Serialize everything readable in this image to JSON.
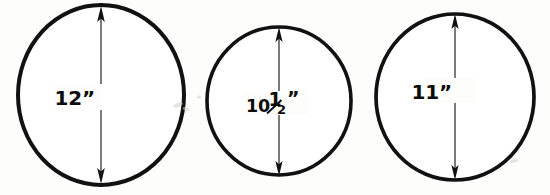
{
  "figure": {
    "type": "technical-dimension-diagram",
    "background_color": "#fdfdfc",
    "ink_color": "#111111",
    "circle_count": 3
  },
  "circles": [
    {
      "id": "circle-1",
      "label": "12”",
      "diameter_value": "12",
      "unit_symbol": "”",
      "cx": 101,
      "cy": 95,
      "rx": 83,
      "ry": 90,
      "stroke_width": 4.0,
      "dimension": {
        "line_x": 101,
        "top_y": 8,
        "bottom_y": 182,
        "label_x": 95,
        "label_y": 104,
        "label_anchor": "end"
      }
    },
    {
      "id": "circle-2",
      "label": "10½”",
      "diameter_value": "10½",
      "whole_part": "10",
      "fraction_numerator": "1",
      "fraction_denominator": "2",
      "unit_symbol": "”",
      "cx": 279,
      "cy": 101,
      "rx": 72,
      "ry": 74,
      "stroke_width": 3.6,
      "dimension": {
        "line_x": 279,
        "top_y": 29,
        "bottom_y": 174,
        "label_x": 272,
        "label_y": 111,
        "label_anchor": "end"
      }
    },
    {
      "id": "circle-3",
      "label": "11”",
      "diameter_value": "11",
      "unit_symbol": "”",
      "cx": 455,
      "cy": 97,
      "rx": 79,
      "ry": 83,
      "stroke_width": 3.7,
      "dimension": {
        "line_x": 455,
        "top_y": 16,
        "bottom_y": 178,
        "label_x": 450,
        "label_y": 98,
        "label_anchor": "end"
      }
    }
  ],
  "artifacts": {
    "specks": [
      {
        "x": 174,
        "y": 104,
        "w": 9,
        "h": 4,
        "rot": -20
      },
      {
        "x": 183,
        "y": 108,
        "w": 6,
        "h": 3,
        "rot": 15
      },
      {
        "x": 198,
        "y": 96,
        "w": 4,
        "h": 3,
        "rot": 0
      },
      {
        "x": 511,
        "y": 160,
        "w": 7,
        "h": 3,
        "rot": -10
      }
    ]
  }
}
